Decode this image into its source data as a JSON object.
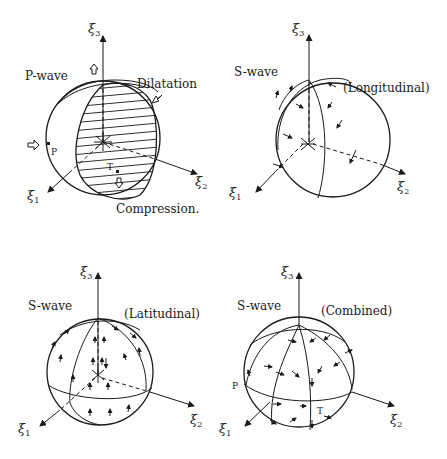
{
  "figure": {
    "panels": [
      {
        "id": "p-wave",
        "title": "P-wave",
        "labels": {
          "dilatation": "Dilatation",
          "compression": "Compression.",
          "p_point": "P",
          "t_point": "T"
        },
        "axes": {
          "x1": "ξ",
          "x1_sub": "1",
          "x2": "ξ",
          "x2_sub": "2",
          "x3": "ξ",
          "x3_sub": "3"
        }
      },
      {
        "id": "s-wave-longitudinal",
        "title": "S-wave",
        "subtitle": "(Longitudinal)",
        "axes": {
          "x1": "ξ",
          "x1_sub": "1",
          "x2": "ξ",
          "x2_sub": "2",
          "x3": "ξ",
          "x3_sub": "3"
        }
      },
      {
        "id": "s-wave-latitudinal",
        "title": "S-wave",
        "subtitle": "(Latitudinal)",
        "axes": {
          "x1": "ξ",
          "x1_sub": "1",
          "x2": "ξ",
          "x2_sub": "2",
          "x3": "ξ",
          "x3_sub": "3"
        }
      },
      {
        "id": "s-wave-combined",
        "title": "S-wave",
        "subtitle": "(Combined)",
        "labels": {
          "p_point": "P",
          "t_point": "T"
        },
        "axes": {
          "x1": "ξ",
          "x1_sub": "1",
          "x2": "ξ",
          "x2_sub": "2",
          "x3": "ξ",
          "x3_sub": "3"
        }
      }
    ],
    "colors": {
      "ink": "#1a1a1a",
      "background": "#ffffff"
    }
  }
}
